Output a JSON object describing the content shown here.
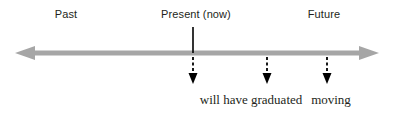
{
  "figure": {
    "name": "verb-tense-timeline",
    "background_color": "#ffffff",
    "width": 395,
    "height": 115
  },
  "axis": {
    "name": "timeline-axis",
    "color": "#a6a6a6",
    "y": 53,
    "x_start": 15,
    "x_end": 379,
    "left_arrow": "arrow-left",
    "right_arrow": "arrow-right",
    "thickness": 5
  },
  "present_marker": {
    "name": "present-tick",
    "x": 193,
    "y_top": 27,
    "y_bottom": 53,
    "color": "#000000"
  },
  "top_labels": [
    {
      "text": "Past",
      "x": 66,
      "y": 8
    },
    {
      "text": "Present (now)",
      "x": 196,
      "y": 8
    },
    {
      "text": "Future",
      "x": 324,
      "y": 8
    }
  ],
  "event_arrows": [
    {
      "name": "arrow-present-event",
      "x": 193,
      "y_top": 57,
      "y_tip": 84,
      "color": "#000000"
    },
    {
      "name": "arrow-graduated",
      "x": 267,
      "y_top": 57,
      "y_tip": 84,
      "color": "#000000"
    },
    {
      "name": "arrow-moving",
      "x": 327,
      "y_top": 57,
      "y_tip": 84,
      "color": "#000000"
    }
  ],
  "bottom_labels": [
    {
      "text": "will have graduated",
      "x": 251,
      "y": 92
    },
    {
      "text": "moving",
      "x": 331,
      "y": 92
    }
  ]
}
